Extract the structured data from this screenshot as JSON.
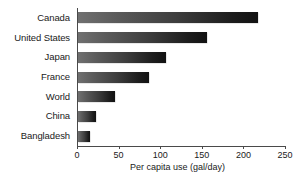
{
  "chart_data": {
    "type": "bar",
    "orientation": "horizontal",
    "title": "",
    "xlabel": "Per capita use (gal/day)",
    "ylabel": "",
    "categories": [
      "Canada",
      "United States",
      "Japan",
      "France",
      "World",
      "China",
      "Bangladesh"
    ],
    "values": [
      216,
      155,
      106,
      85,
      44,
      22,
      15
    ],
    "xlim": [
      0,
      250
    ],
    "xticks": [
      0,
      50,
      100,
      150,
      200,
      250
    ],
    "xtick_labels": [
      "0",
      "50",
      "100",
      "150",
      "200",
      "250"
    ],
    "grid": false,
    "legend": null,
    "series": [
      {
        "name": "Per capita use (gal/day)",
        "values": [
          216,
          155,
          106,
          85,
          44,
          22,
          15
        ]
      }
    ],
    "bar_fill": "gradient-gray-to-black",
    "colors": {
      "bar_start": "#707070",
      "bar_end": "#111111",
      "axis": "#4a4a4a",
      "text": "#1a1a1a",
      "background": "#ffffff"
    }
  }
}
